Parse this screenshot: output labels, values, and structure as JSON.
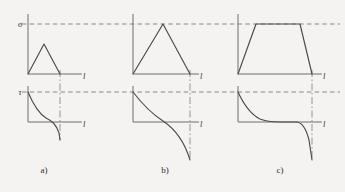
{
  "figure": {
    "background_color": "#f4f3f1",
    "line_color": "#4a4a4a",
    "axis_color": "#6e6e6e",
    "reference_line_color": "#7d7d7d",
    "panels": [
      {
        "id": "a",
        "label": "a)",
        "upper": {
          "y_symbol": "σ",
          "x_symbol": "l",
          "shape": "triangle",
          "peak_reaches_reference": false
        },
        "lower": {
          "y_symbol": "τ",
          "x_symbol": "l",
          "shape": "decaying-curve-with-drop",
          "starts_at_reference": true
        }
      },
      {
        "id": "b",
        "label": "b)",
        "upper": {
          "y_symbol": "σ",
          "x_symbol": "l",
          "shape": "triangle",
          "peak_reaches_reference": true
        },
        "lower": {
          "y_symbol": "τ",
          "x_symbol": "l",
          "shape": "decaying-curve-with-drop",
          "starts_at_reference": true
        }
      },
      {
        "id": "c",
        "label": "c)",
        "upper": {
          "y_symbol": "σ",
          "x_symbol": "l",
          "shape": "trapezoid",
          "peak_reaches_reference": true
        },
        "lower": {
          "y_symbol": "τ",
          "x_symbol": "l",
          "shape": "decaying-curve-flat-then-drop",
          "starts_at_reference": true
        }
      }
    ],
    "reference_lines": [
      {
        "name": "sigma-reference",
        "symbol": "σ"
      },
      {
        "name": "tau-reference",
        "symbol": "τ"
      }
    ]
  },
  "labels": {
    "sigma": "σ",
    "tau": "τ",
    "axis_l": "l",
    "panel_a": "a)",
    "panel_b": "b)",
    "panel_c": "c)"
  }
}
